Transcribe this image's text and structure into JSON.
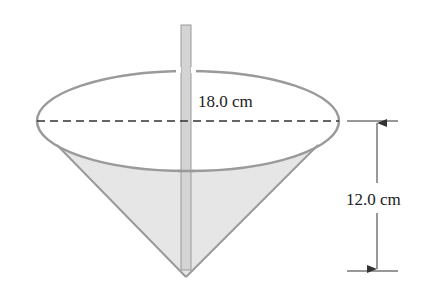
{
  "diagram": {
    "type": "cone-with-rod",
    "labels": {
      "diameter": "18.0 cm",
      "height": "12.0 cm"
    },
    "colors": {
      "outline": "#9a9a9a",
      "liquid_fill": "#e6e6e6",
      "rod_fill": "#d4d4d4",
      "rod_stroke": "#9a9a9a",
      "dashed_line": "#333333",
      "dimension_line": "#333333",
      "background": "#ffffff"
    },
    "dimensions": {
      "diameter_value": 18.0,
      "height_value": 12.0,
      "unit": "cm"
    }
  }
}
